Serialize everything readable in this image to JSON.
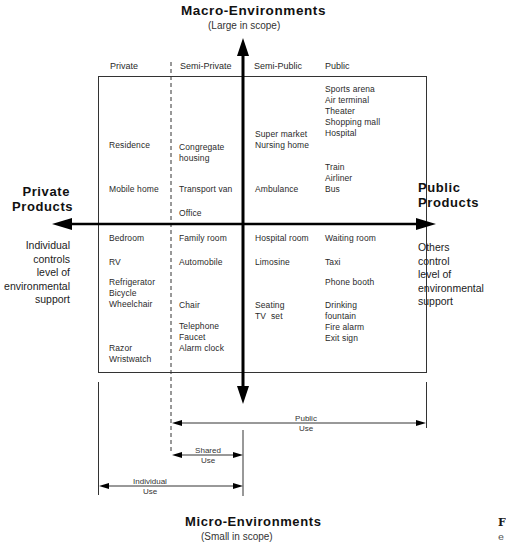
{
  "top": {
    "title": "Macro-Environments",
    "subtitle": "(Large in scope)"
  },
  "bottom": {
    "title": "Micro-Environments",
    "subtitle": "(Small in scope)"
  },
  "left": {
    "title_line1": "Private",
    "title_line2": "Products",
    "desc": "Individual\ncontrols\nlevel of\nenvironmental\nsupport"
  },
  "right": {
    "title_line1": "Public",
    "title_line2": "Products",
    "desc": "Others\ncontrol\nlevel of\nenvironmental\nsupport"
  },
  "columns": [
    "Private",
    "Semi-Private",
    "Semi-Public",
    "Public"
  ],
  "cells": {
    "private": [
      "Residence",
      "Mobile home",
      "Bedroom",
      "RV",
      "Refrigerator\nBicycle\nWheelchair",
      "Razor\nWristwatch"
    ],
    "semi_private": [
      "Congregate\nhousing",
      "Transport van",
      "Office",
      "Family room",
      "Automobile",
      "Chair",
      "Telephone\nFaucet\nAlarm clock"
    ],
    "semi_public": [
      "Super market\nNursing home",
      "Ambulance",
      "Hospital room",
      "Limosine",
      "Seating\nTV  set"
    ],
    "public": [
      "Sports arena\nAir terminal\nTheater\nShopping mall\nHospital",
      "Train\nAirliner\nBus",
      "Waiting room",
      "Taxi",
      "Phone booth",
      "Drinking\nfountain\nFire alarm\nExit sign"
    ]
  },
  "use_ranges": {
    "public": "Public\nUse",
    "shared": "Shared\nUse",
    "individual": "Individual\nUse"
  },
  "caption_fragment": {
    "line1": "F",
    "line2": "e"
  }
}
